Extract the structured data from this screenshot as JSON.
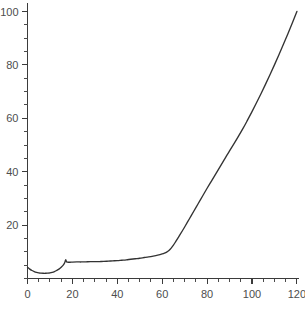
{
  "chart_data": {
    "type": "line",
    "title": "",
    "subtitle": "",
    "xlabel": "",
    "ylabel": "",
    "xlim": [
      0,
      121
    ],
    "ylim": [
      0,
      103
    ],
    "grid": false,
    "legend": null,
    "legend_position": "none",
    "line_color": "#333333",
    "background_color": "#ffffff",
    "tick_label_color": "#4d4d4d",
    "axis_color": "#3b3b3b",
    "x_ticks_major": [
      0,
      20,
      40,
      60,
      80,
      100,
      120
    ],
    "x_tick_labels": [
      "0",
      "20",
      "40",
      "60",
      "80",
      "100",
      "120"
    ],
    "x_ticks_minor_step": 5,
    "y_ticks_major": [
      20,
      40,
      60,
      80,
      100
    ],
    "y_tick_labels": [
      "20",
      "40",
      "60",
      "80",
      "100"
    ],
    "y_ticks_minor_step": 5,
    "series": [
      {
        "name": "curve",
        "x": [
          0,
          1,
          2,
          3,
          4,
          5,
          6,
          7,
          8,
          9,
          10,
          11,
          12,
          13,
          14,
          15,
          16,
          16.6,
          17,
          17.4,
          18,
          19,
          20,
          22,
          24,
          26,
          28,
          30,
          32,
          34,
          36,
          38,
          40,
          42,
          44,
          46,
          48,
          50,
          52,
          54,
          56,
          58,
          60,
          61,
          62,
          63,
          64,
          65,
          66,
          68,
          70,
          72,
          74,
          76,
          78,
          80,
          82,
          84,
          86,
          88,
          90,
          92,
          94,
          96,
          98,
          100,
          102,
          104,
          106,
          108,
          110,
          112,
          114,
          116,
          118,
          120
        ],
        "y": [
          4.2,
          3.5,
          3.0,
          2.6,
          2.3,
          2.1,
          2.0,
          1.95,
          1.95,
          2.0,
          2.1,
          2.3,
          2.6,
          3.0,
          3.5,
          4.2,
          5.1,
          6.0,
          7.0,
          6.3,
          6.1,
          6.1,
          6.15,
          6.2,
          6.2,
          6.25,
          6.3,
          6.3,
          6.35,
          6.4,
          6.5,
          6.6,
          6.7,
          6.85,
          7.0,
          7.2,
          7.4,
          7.6,
          7.85,
          8.1,
          8.4,
          8.75,
          9.2,
          9.5,
          9.9,
          10.5,
          11.4,
          12.5,
          13.8,
          16.5,
          19.3,
          22.2,
          25.1,
          28.0,
          30.9,
          33.8,
          36.6,
          39.4,
          42.2,
          45.0,
          47.8,
          50.5,
          53.3,
          56.2,
          59.3,
          62.5,
          65.8,
          69.2,
          72.7,
          76.3,
          80.0,
          83.8,
          87.7,
          91.7,
          95.8,
          100.0
        ]
      }
    ]
  }
}
